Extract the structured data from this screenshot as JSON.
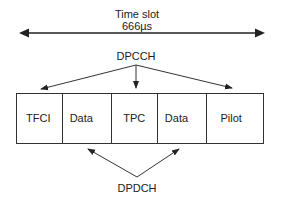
{
  "diagram": {
    "timeslot": {
      "title": "Time slot",
      "duration": "666µs"
    },
    "dpcch_label": "DPCCH",
    "dpdch_label": "DPDCH",
    "fields": [
      {
        "label": "TFCI",
        "type": "DPCCH",
        "width": 46
      },
      {
        "label": "Data",
        "type": "DPDCH",
        "width": 50
      },
      {
        "label": "TPC",
        "type": "DPCCH",
        "width": 46
      },
      {
        "label": "Data",
        "type": "DPDCH",
        "width": 50
      },
      {
        "label": "Pilot",
        "type": "DPCCH",
        "width": 56
      }
    ],
    "colors": {
      "line": "#333333",
      "text": "#222222",
      "background": "#ffffff"
    }
  }
}
